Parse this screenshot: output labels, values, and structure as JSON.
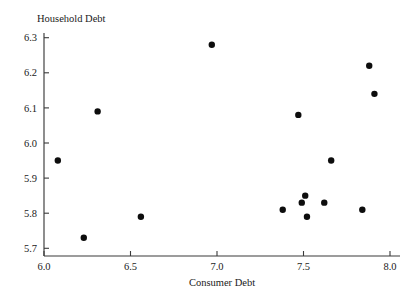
{
  "chart_data": {
    "type": "scatter",
    "title": "",
    "xlabel": "Consumer Debt",
    "ylabel": "Household Debt",
    "xlim": [
      6.0,
      8.0
    ],
    "ylim": [
      5.7,
      6.3
    ],
    "xticks": [
      "6.0",
      "6.5",
      "7.0",
      "7.5",
      "8.0"
    ],
    "yticks": [
      "5.7",
      "5.8",
      "5.9",
      "6.0",
      "6.1",
      "6.2",
      "6.3"
    ],
    "xtick_values": [
      6.0,
      6.5,
      7.0,
      7.5,
      8.0
    ],
    "ytick_values": [
      5.7,
      5.8,
      5.9,
      6.0,
      6.1,
      6.2,
      6.3
    ],
    "grid": false,
    "legend": null,
    "marker": "filled-circle",
    "marker_color": "#0d0d0d",
    "marker_size_px": 4.2,
    "x": [
      6.08,
      6.23,
      6.31,
      6.56,
      6.97,
      7.38,
      7.47,
      7.49,
      7.51,
      7.52,
      7.62,
      7.66,
      7.84,
      7.88,
      7.91
    ],
    "y": [
      5.95,
      5.73,
      6.09,
      5.79,
      6.28,
      5.81,
      6.08,
      5.83,
      5.85,
      5.79,
      5.83,
      5.95,
      5.81,
      6.22,
      6.14
    ],
    "points": [
      {
        "x": 6.08,
        "y": 5.95
      },
      {
        "x": 6.23,
        "y": 5.73
      },
      {
        "x": 6.31,
        "y": 6.09
      },
      {
        "x": 6.56,
        "y": 5.79
      },
      {
        "x": 6.97,
        "y": 6.28
      },
      {
        "x": 7.38,
        "y": 5.81
      },
      {
        "x": 7.47,
        "y": 6.08
      },
      {
        "x": 7.49,
        "y": 5.83
      },
      {
        "x": 7.51,
        "y": 5.85
      },
      {
        "x": 7.52,
        "y": 5.79
      },
      {
        "x": 7.62,
        "y": 5.83
      },
      {
        "x": 7.66,
        "y": 5.95
      },
      {
        "x": 7.84,
        "y": 5.81
      },
      {
        "x": 7.88,
        "y": 6.22
      },
      {
        "x": 7.91,
        "y": 6.14
      }
    ]
  },
  "axes": {
    "x_title": "Consumer Debt",
    "y_title": "Household Debt"
  },
  "colors": {
    "marker": "#0d0d0d",
    "axis": "#3a3a3a",
    "text": "#1a1a1a",
    "background": "#ffffff"
  }
}
